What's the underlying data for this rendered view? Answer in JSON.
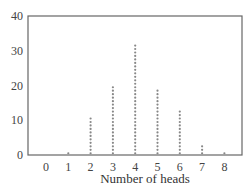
{
  "chart_data": {
    "type": "dotplot",
    "title": "",
    "xlabel": "Number of heads",
    "ylabel": "",
    "categories": [
      "0",
      "1",
      "2",
      "3",
      "4",
      "5",
      "6",
      "7",
      "8"
    ],
    "values": [
      0,
      1,
      11,
      20,
      32,
      19,
      13,
      3,
      1
    ],
    "ylim": [
      0,
      40
    ],
    "yticks": [
      0,
      10,
      20,
      30,
      40
    ],
    "grid": false,
    "legend": null
  },
  "colors": {
    "axis": "#666666",
    "dots": "#888888",
    "text": "#333333"
  }
}
